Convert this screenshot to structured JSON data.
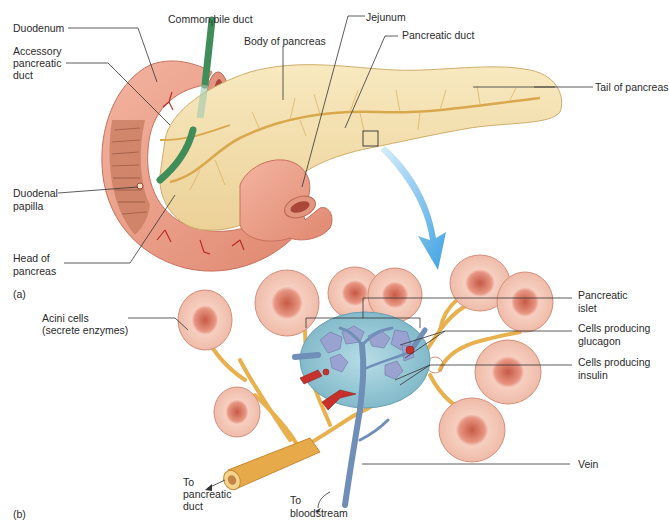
{
  "figure": {
    "panel_a": {
      "tag": "(a)",
      "labels": {
        "duodenum": "Duodenum",
        "common_bile_duct": "Common bile duct",
        "accessory_duct_1": "Accessory",
        "accessory_duct_2": "pancreatic",
        "accessory_duct_3": "duct",
        "body": "Body of pancreas",
        "jejunum": "Jejunum",
        "pancreatic_duct": "Pancreatic duct",
        "tail": "Tail of pancreas",
        "papilla_1": "Duodenal",
        "papilla_2": "papilla",
        "head_1": "Head of",
        "head_2": "pancreas"
      }
    },
    "panel_b": {
      "tag": "(b)",
      "labels": {
        "acini_1": "Acini cells",
        "acini_2": "(secrete enzymes)",
        "islet_1": "Pancreatic",
        "islet_2": "islet",
        "glucagon_1": "Cells producing",
        "glucagon_2": "glucagon",
        "insulin_1": "Cells producing",
        "insulin_2": "insulin",
        "vein": "Vein",
        "to_duct_1": "To",
        "to_duct_2": "pancreatic",
        "to_duct_3": "duct",
        "to_blood_1": "To",
        "to_blood_2": "bloodstream"
      }
    },
    "colors": {
      "pancreas": "#f3deaa",
      "duodenum": "#e99a86",
      "bile_duct": "#3f8d5a",
      "islet": "#8fc4d3",
      "vein": "#6f8fb8",
      "artery": "#c8312b",
      "duct": "#e9b14e",
      "acinus": "#f2bfae",
      "arrow": "#5fb3e8"
    }
  }
}
